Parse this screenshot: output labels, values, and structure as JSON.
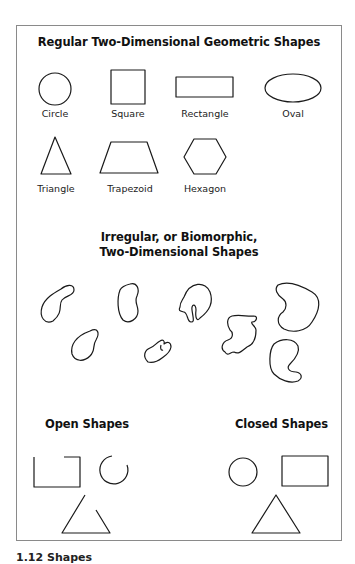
{
  "figure": {
    "caption": "1.12 Shapes",
    "sections": {
      "regular": {
        "title": "Regular Two-Dimensional Geometric Shapes",
        "shapes": [
          {
            "label": "Circle",
            "icon": "circle-shape"
          },
          {
            "label": "Square",
            "icon": "square-shape"
          },
          {
            "label": "Rectangle",
            "icon": "rectangle-shape"
          },
          {
            "label": "Oval",
            "icon": "oval-shape"
          },
          {
            "label": "Triangle",
            "icon": "triangle-shape"
          },
          {
            "label": "Trapezoid",
            "icon": "trapezoid-shape"
          },
          {
            "label": "Hexagon",
            "icon": "hexagon-shape"
          }
        ]
      },
      "irregular": {
        "title_line1": "Irregular, or Biomorphic,",
        "title_line2": "Two-Dimensional Shapes",
        "shape_count": 8
      },
      "open": {
        "title": "Open Shapes",
        "shapes": [
          "open-square-shape",
          "open-circle-shape",
          "open-triangle-shape"
        ]
      },
      "closed": {
        "title": "Closed Shapes",
        "shapes": [
          "closed-circle-shape",
          "closed-rectangle-shape",
          "closed-triangle-shape"
        ]
      }
    },
    "colors": {
      "stroke": "#1a1a1a",
      "frame": "#8a8a8a",
      "background": "#ffffff"
    }
  }
}
